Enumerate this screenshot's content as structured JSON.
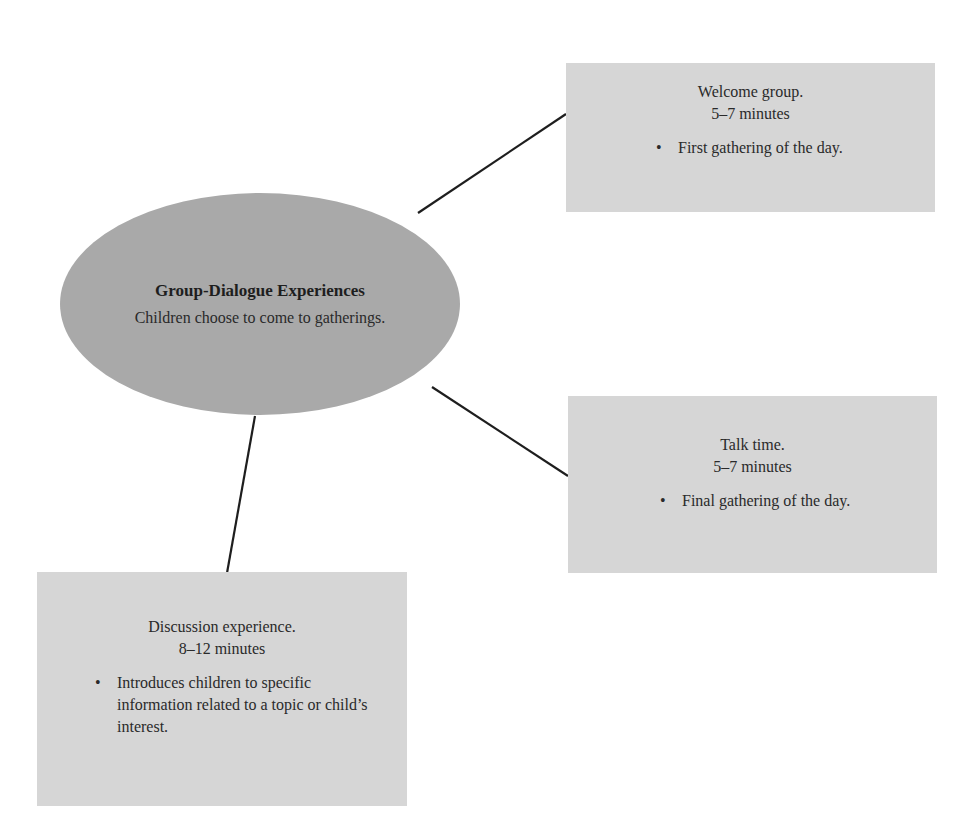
{
  "diagram": {
    "type": "mind-map",
    "colors": {
      "hub_fill": "#a9a9a9",
      "box_fill": "#d6d6d6",
      "connector": "#1e1e1e",
      "text": "#2a2a2a"
    },
    "hub": {
      "title": "Group-Dialogue Experiences",
      "subtitle": "Children choose to come to gatherings."
    },
    "nodes": [
      {
        "id": "welcome",
        "title": "Welcome group.",
        "duration": "5–7 minutes",
        "bullets": [
          "First gathering of the day."
        ]
      },
      {
        "id": "talk",
        "title": "Talk time.",
        "duration": "5–7 minutes",
        "bullets": [
          "Final gathering of the day."
        ]
      },
      {
        "id": "discussion",
        "title": "Discussion experience.",
        "duration": "8–12 minutes",
        "bullets": [
          "Introduces children to specific information related to a topic or child’s interest."
        ]
      }
    ],
    "bullet_glyph": "•"
  }
}
